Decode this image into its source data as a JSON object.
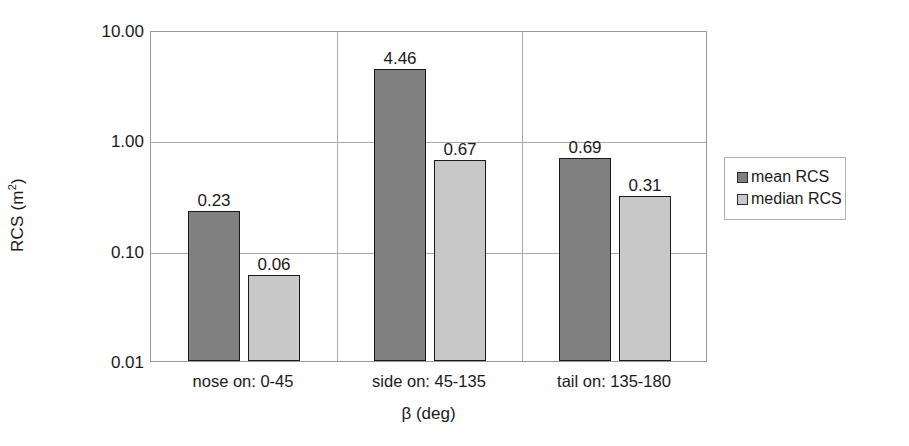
{
  "chart_data": {
    "type": "bar",
    "title": "",
    "xlabel": "β (deg)",
    "ylabel": "RCS (m²)",
    "yscale": "log",
    "ylim": [
      0.01,
      10.0
    ],
    "ytick_labels": [
      "10.00",
      "1.00",
      "0.10",
      "0.01"
    ],
    "ytick_values": [
      10.0,
      1.0,
      0.1,
      0.01
    ],
    "grid": true,
    "legend_position": "right",
    "categories": [
      "nose on:  0-45",
      "side on: 45-135",
      "tail on: 135-180"
    ],
    "series": [
      {
        "name": "mean RCS",
        "color": "#808080",
        "values": [
          0.23,
          4.46,
          0.69
        ],
        "value_labels": [
          "0.23",
          "4.46",
          "0.69"
        ]
      },
      {
        "name": "median RCS",
        "color": "#c8c8c8",
        "values": [
          0.06,
          0.67,
          0.31
        ],
        "value_labels": [
          "0.06",
          "0.67",
          "0.31"
        ]
      }
    ]
  },
  "axes": {
    "y_title_main": "RCS (m",
    "y_title_sup": "2",
    "y_title_close": ")",
    "x_title": "β (deg)"
  },
  "legend": {
    "entries": [
      {
        "label": "mean RCS"
      },
      {
        "label": "median RCS"
      }
    ]
  }
}
